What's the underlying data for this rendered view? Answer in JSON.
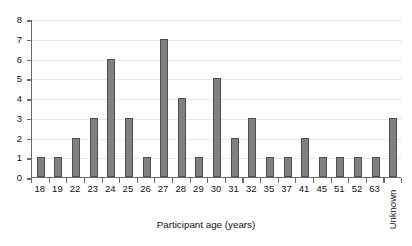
{
  "chart_data": {
    "type": "bar",
    "title": "",
    "xlabel": "Participant age (years)",
    "ylabel": "",
    "categories": [
      "18",
      "19",
      "22",
      "23",
      "24",
      "25",
      "26",
      "27",
      "28",
      "29",
      "30",
      "31",
      "32",
      "35",
      "37",
      "41",
      "45",
      "51",
      "52",
      "63",
      "Unknown"
    ],
    "values": [
      1,
      1,
      2,
      3,
      6,
      3,
      1,
      7,
      4,
      1,
      5,
      2,
      3,
      1,
      1,
      2,
      1,
      1,
      1,
      1,
      3
    ],
    "ylim": [
      0,
      8
    ],
    "yticks": [
      "0",
      "1",
      "2",
      "3",
      "4",
      "5",
      "6",
      "7",
      "8"
    ],
    "grid": "horizontal",
    "legend": "none",
    "bar_color": "#808080",
    "bar_edge_color": "#4f4f4f",
    "gridline_color": "#e9e9e9",
    "axis_color": "#6b6b6b",
    "background_color": "#ffffff"
  }
}
